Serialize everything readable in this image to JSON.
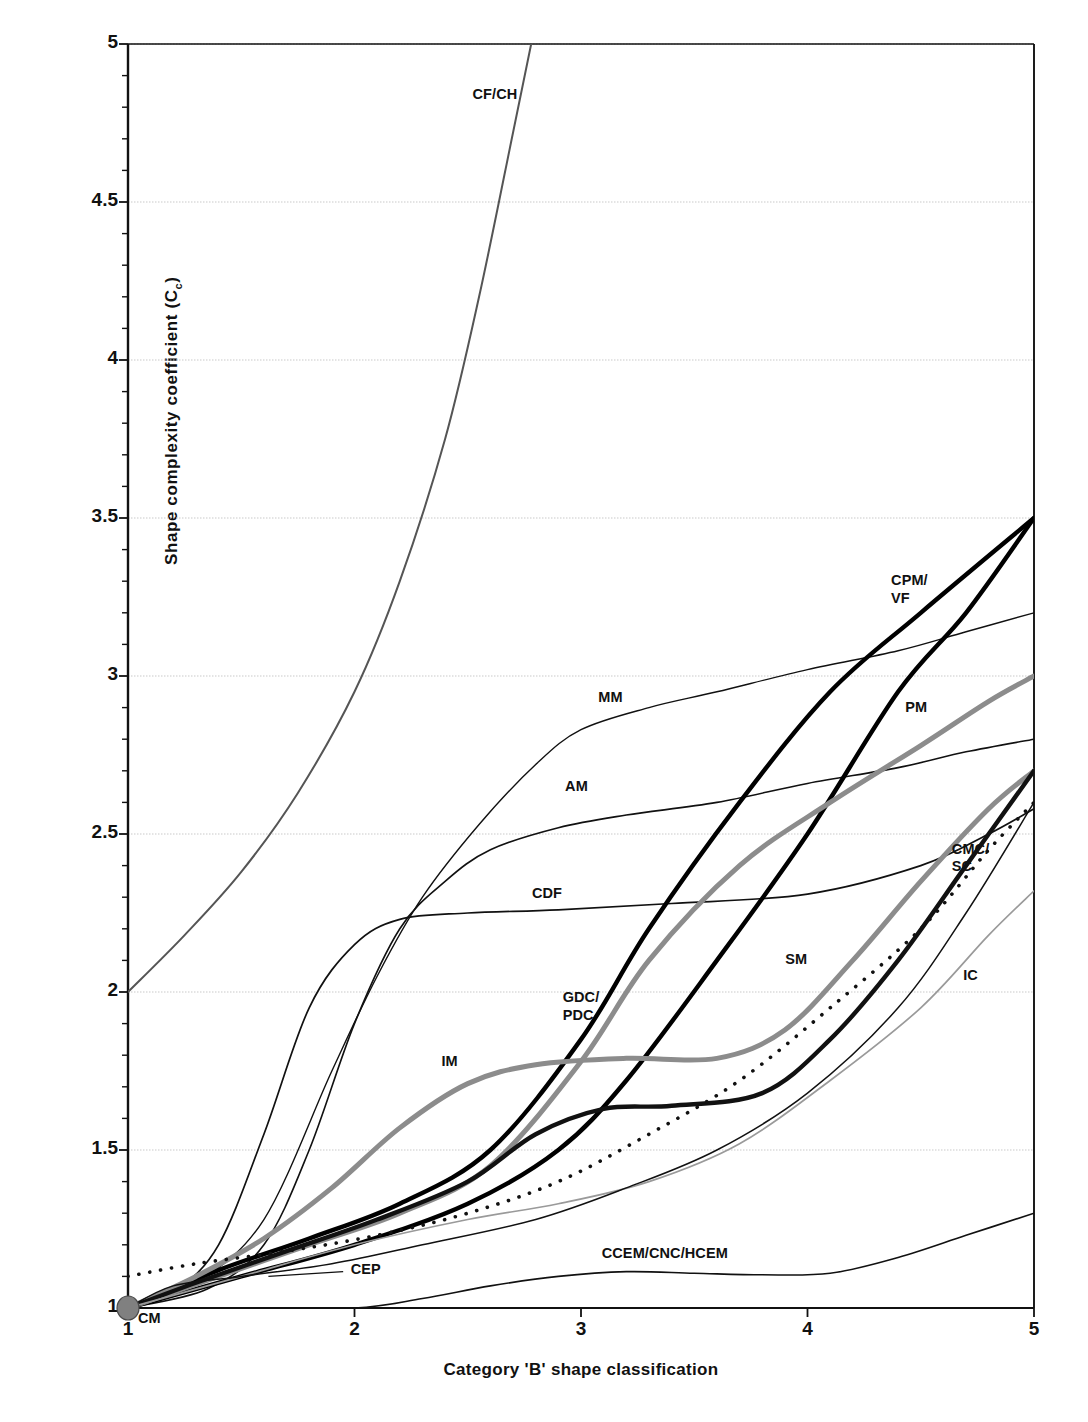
{
  "chart_data": {
    "type": "line",
    "title": "",
    "xlabel": "Category 'B' shape classification",
    "ylabel": "Shape complexity coefficient (C",
    "ylabel_sub": "c",
    "ylabel_tail": ")",
    "xlim": [
      1,
      5
    ],
    "ylim": [
      1,
      5
    ],
    "xticks": [
      "1",
      "2",
      "3",
      "4",
      "5"
    ],
    "yticks": [
      "1",
      "1.5",
      "2",
      "2.5",
      "3",
      "3.5",
      "4",
      "4.5",
      "5"
    ],
    "grid": "horizontal-dotted",
    "legend": "inline-labels",
    "origin_marker": {
      "label": "CM",
      "x": 1,
      "y": 1,
      "color": "#808080"
    },
    "series": [
      {
        "name": "CF/CH",
        "label": "CF/CH",
        "color": "#555555",
        "width": 2.0,
        "style": "solid",
        "label_x": 2.62,
        "label_y": 4.84,
        "points": [
          [
            1,
            2.0
          ],
          [
            1.25,
            2.18
          ],
          [
            1.5,
            2.38
          ],
          [
            1.75,
            2.63
          ],
          [
            2.0,
            2.95
          ],
          [
            2.2,
            3.3
          ],
          [
            2.4,
            3.75
          ],
          [
            2.55,
            4.2
          ],
          [
            2.7,
            4.72
          ],
          [
            2.78,
            5.0
          ]
        ]
      },
      {
        "name": "MM",
        "label": "MM",
        "color": "#111111",
        "width": 1.4,
        "style": "solid",
        "label_x": 3.13,
        "label_y": 2.93,
        "points": [
          [
            1,
            1.0
          ],
          [
            1.3,
            1.08
          ],
          [
            1.6,
            1.28
          ],
          [
            1.9,
            1.75
          ],
          [
            2.1,
            2.05
          ],
          [
            2.3,
            2.3
          ],
          [
            2.55,
            2.53
          ],
          [
            2.8,
            2.72
          ],
          [
            3.0,
            2.83
          ],
          [
            3.3,
            2.9
          ],
          [
            3.6,
            2.95
          ],
          [
            4.0,
            3.02
          ],
          [
            4.4,
            3.08
          ],
          [
            4.7,
            3.14
          ],
          [
            5.0,
            3.2
          ]
        ]
      },
      {
        "name": "AM",
        "label": "AM",
        "color": "#111111",
        "width": 1.6,
        "style": "solid",
        "label_x": 2.98,
        "label_y": 2.65,
        "points": [
          [
            1,
            1.0
          ],
          [
            1.35,
            1.06
          ],
          [
            1.6,
            1.2
          ],
          [
            1.8,
            1.5
          ],
          [
            2.0,
            1.9
          ],
          [
            2.2,
            2.2
          ],
          [
            2.4,
            2.35
          ],
          [
            2.6,
            2.45
          ],
          [
            2.9,
            2.52
          ],
          [
            3.2,
            2.56
          ],
          [
            3.6,
            2.6
          ],
          [
            4.0,
            2.66
          ],
          [
            4.4,
            2.71
          ],
          [
            4.7,
            2.76
          ],
          [
            5.0,
            2.8
          ]
        ]
      },
      {
        "name": "CDF",
        "label": "CDF",
        "color": "#111111",
        "width": 1.7,
        "style": "solid",
        "label_x": 2.85,
        "label_y": 2.31,
        "points": [
          [
            1,
            1.0
          ],
          [
            1.2,
            1.05
          ],
          [
            1.4,
            1.2
          ],
          [
            1.6,
            1.55
          ],
          [
            1.8,
            1.95
          ],
          [
            2.0,
            2.15
          ],
          [
            2.2,
            2.23
          ],
          [
            2.5,
            2.25
          ],
          [
            2.9,
            2.26
          ],
          [
            3.4,
            2.28
          ],
          [
            4.0,
            2.31
          ],
          [
            4.5,
            2.4
          ],
          [
            4.8,
            2.5
          ],
          [
            5.0,
            2.58
          ]
        ]
      },
      {
        "name": "CPM/VF",
        "label": "CPM/\nVF",
        "color": "#000000",
        "width": 4.4,
        "style": "solid",
        "label_x": 4.45,
        "label_y": 3.3,
        "points": [
          [
            1,
            1.0
          ],
          [
            1.4,
            1.12
          ],
          [
            1.8,
            1.22
          ],
          [
            2.2,
            1.33
          ],
          [
            2.6,
            1.5
          ],
          [
            3.0,
            1.85
          ],
          [
            3.3,
            2.2
          ],
          [
            3.7,
            2.6
          ],
          [
            4.1,
            2.95
          ],
          [
            4.5,
            3.2
          ],
          [
            5.0,
            3.5
          ]
        ]
      },
      {
        "name": "PM",
        "label": "PM",
        "color": "#000000",
        "width": 4.4,
        "style": "solid",
        "label_x": 4.48,
        "label_y": 2.9,
        "points": [
          [
            1,
            1.0
          ],
          [
            1.5,
            1.1
          ],
          [
            2.0,
            1.2
          ],
          [
            2.5,
            1.33
          ],
          [
            2.9,
            1.5
          ],
          [
            3.2,
            1.72
          ],
          [
            3.6,
            2.1
          ],
          [
            4.0,
            2.5
          ],
          [
            4.4,
            2.95
          ],
          [
            4.7,
            3.2
          ],
          [
            5.0,
            3.5
          ]
        ]
      },
      {
        "name": "GDC/PDC",
        "label": "GDC/\nPDC",
        "color": "#8c8c8c",
        "width": 5.0,
        "style": "solid",
        "label_x": 3.0,
        "label_y": 1.98,
        "points": [
          [
            1,
            1.0
          ],
          [
            1.4,
            1.1
          ],
          [
            1.8,
            1.2
          ],
          [
            2.2,
            1.3
          ],
          [
            2.6,
            1.45
          ],
          [
            3.0,
            1.78
          ],
          [
            3.3,
            2.1
          ],
          [
            3.7,
            2.4
          ],
          [
            4.1,
            2.6
          ],
          [
            4.5,
            2.78
          ],
          [
            4.8,
            2.92
          ],
          [
            5.0,
            3.0
          ]
        ]
      },
      {
        "name": "IM",
        "label": "IM",
        "color": "#8c8c8c",
        "width": 5.0,
        "style": "solid",
        "label_x": 2.42,
        "label_y": 1.78,
        "points": [
          [
            1,
            1.0
          ],
          [
            1.3,
            1.1
          ],
          [
            1.6,
            1.22
          ],
          [
            1.9,
            1.38
          ],
          [
            2.2,
            1.57
          ],
          [
            2.5,
            1.71
          ],
          [
            2.8,
            1.77
          ],
          [
            3.2,
            1.79
          ],
          [
            3.6,
            1.79
          ],
          [
            3.9,
            1.88
          ],
          [
            4.2,
            2.1
          ],
          [
            4.5,
            2.35
          ],
          [
            4.8,
            2.58
          ],
          [
            5.0,
            2.7
          ]
        ]
      },
      {
        "name": "SM",
        "label": "SM",
        "color": "#111111",
        "width": 4.4,
        "style": "solid",
        "label_x": 3.95,
        "label_y": 2.1,
        "points": [
          [
            1,
            1.0
          ],
          [
            1.3,
            1.08
          ],
          [
            1.7,
            1.18
          ],
          [
            2.1,
            1.28
          ],
          [
            2.5,
            1.4
          ],
          [
            2.8,
            1.55
          ],
          [
            3.1,
            1.63
          ],
          [
            3.4,
            1.64
          ],
          [
            3.8,
            1.68
          ],
          [
            4.1,
            1.85
          ],
          [
            4.4,
            2.1
          ],
          [
            4.7,
            2.4
          ],
          [
            5.0,
            2.7
          ]
        ]
      },
      {
        "name": "CMC/SC",
        "label": "CMC/\nSC",
        "color": "#111111",
        "width": 3.6,
        "style": "dotted",
        "label_x": 4.72,
        "label_y": 2.45,
        "points": [
          [
            1,
            1.1
          ],
          [
            1.3,
            1.14
          ],
          [
            1.7,
            1.18
          ],
          [
            2.1,
            1.23
          ],
          [
            2.5,
            1.3
          ],
          [
            2.9,
            1.4
          ],
          [
            3.3,
            1.55
          ],
          [
            3.7,
            1.72
          ],
          [
            4.1,
            1.95
          ],
          [
            4.5,
            2.2
          ],
          [
            4.8,
            2.45
          ],
          [
            5.0,
            2.6
          ]
        ]
      },
      {
        "name": "IC",
        "label": "IC",
        "color": "#9a9a9a",
        "width": 1.7,
        "style": "solid",
        "label_x": 4.72,
        "label_y": 2.05,
        "points": [
          [
            1,
            1.0
          ],
          [
            1.5,
            1.1
          ],
          [
            2.0,
            1.2
          ],
          [
            2.5,
            1.28
          ],
          [
            2.9,
            1.33
          ],
          [
            3.3,
            1.4
          ],
          [
            3.7,
            1.52
          ],
          [
            4.1,
            1.72
          ],
          [
            4.5,
            1.95
          ],
          [
            4.8,
            2.18
          ],
          [
            5.0,
            2.32
          ]
        ]
      },
      {
        "name": "CEP",
        "label": "CEP",
        "color": "#111111",
        "width": 1.5,
        "style": "solid",
        "label_x": 2.05,
        "label_y": 1.12,
        "leader": [
          [
            1.62,
            1.1
          ],
          [
            1.95,
            1.115
          ]
        ],
        "points": [
          [
            1,
            1.0
          ],
          [
            1.2,
            1.07
          ],
          [
            1.5,
            1.1
          ],
          [
            1.9,
            1.14
          ],
          [
            2.3,
            1.2
          ],
          [
            2.8,
            1.28
          ],
          [
            3.2,
            1.38
          ],
          [
            3.6,
            1.5
          ],
          [
            4.0,
            1.68
          ],
          [
            4.4,
            1.95
          ],
          [
            4.7,
            2.25
          ],
          [
            5.0,
            2.6
          ]
        ]
      },
      {
        "name": "CCEM/CNC/HCEM",
        "label": "CCEM/CNC/HCEM",
        "color": "#111111",
        "width": 1.6,
        "style": "solid",
        "label_x": 3.37,
        "label_y": 1.17,
        "points": [
          [
            1,
            1.0
          ],
          [
            1.5,
            1.0
          ],
          [
            2.0,
            1.0
          ],
          [
            2.3,
            1.03
          ],
          [
            2.6,
            1.07
          ],
          [
            2.9,
            1.1
          ],
          [
            3.2,
            1.115
          ],
          [
            3.5,
            1.11
          ],
          [
            3.8,
            1.105
          ],
          [
            4.1,
            1.11
          ],
          [
            4.4,
            1.16
          ],
          [
            4.7,
            1.23
          ],
          [
            5.0,
            1.3
          ]
        ]
      }
    ]
  }
}
